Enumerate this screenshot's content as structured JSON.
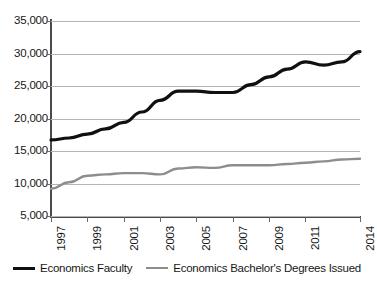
{
  "chart_data": {
    "type": "line",
    "title": "",
    "subtitle": "",
    "xlabel": "",
    "ylabel": "",
    "grid": true,
    "legend_position": "bottom",
    "xlim": [
      1997,
      2014
    ],
    "ylim": [
      5000,
      35000
    ],
    "y_ticks": [
      35000,
      30000,
      25000,
      20000,
      15000,
      10000,
      5000
    ],
    "y_tick_labels": [
      "35,000",
      "30,000",
      "25,000",
      "20,000",
      "15,000",
      "10,000",
      "5,000"
    ],
    "x_ticks": [
      1997,
      1999,
      2001,
      2003,
      2005,
      2007,
      2009,
      2011,
      2014
    ],
    "x_tick_labels": [
      "1997",
      "1999",
      "2001",
      "2003",
      "2005",
      "2007",
      "2009",
      "2011",
      "2014"
    ],
    "x": [
      1997,
      1998,
      1999,
      2000,
      2001,
      2002,
      2003,
      2004,
      2005,
      2006,
      2007,
      2008,
      2009,
      2010,
      2011,
      2012,
      2013,
      2014
    ],
    "series": [
      {
        "name": "Economics Faculty",
        "color": "#101010",
        "line_width": 3.2,
        "values": [
          16700,
          17000,
          17600,
          18400,
          19400,
          21000,
          22800,
          24200,
          24200,
          24000,
          24000,
          25200,
          26400,
          27600,
          28700,
          28200,
          28700,
          30300
        ]
      },
      {
        "name": "Economics Bachelor's Degrees Issued",
        "color": "#8d8d8d",
        "line_width": 2.4,
        "values": [
          9200,
          10200,
          11200,
          11400,
          11600,
          11600,
          11400,
          12300,
          12500,
          12400,
          12800,
          12800,
          12800,
          13000,
          13200,
          13400,
          13700,
          13800
        ]
      }
    ]
  },
  "legend": {
    "items": [
      {
        "label": "Economics Faculty",
        "color": "#101010"
      },
      {
        "label": "Economics Bachelor's Degrees Issued",
        "color": "#8d8d8d"
      }
    ]
  },
  "colors": {
    "background": "#ffffff",
    "grid": "#b5b5b5",
    "axis": "#4a4a4a",
    "text": "#171717",
    "series_faculty": "#101010",
    "series_degrees": "#8d8d8d"
  }
}
